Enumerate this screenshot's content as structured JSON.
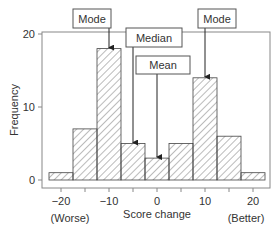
{
  "chart_data": {
    "type": "bar",
    "title": "",
    "xlabel": "Score change",
    "ylabel": "Frequency",
    "categories": [
      "-20",
      "-15",
      "-10",
      "-5",
      "0",
      "5",
      "10",
      "15",
      "20"
    ],
    "x": [
      -20,
      -15,
      -10,
      -5,
      0,
      5,
      10,
      15,
      20
    ],
    "values": [
      1,
      7,
      18,
      5,
      3,
      5,
      14,
      6,
      1
    ],
    "bin_width": 5,
    "xlim": [
      -23,
      24
    ],
    "ylim": [
      0,
      21
    ],
    "xticks": [
      -20,
      -15,
      -10,
      -5,
      0,
      5,
      10,
      15,
      20
    ],
    "xtick_labels": [
      "-20",
      "",
      "-10",
      "",
      "0",
      "",
      "10",
      "",
      "20"
    ],
    "yticks": [
      0,
      10,
      20
    ],
    "ytick_labels": [
      "0",
      "10",
      "20"
    ],
    "x_end_labels": {
      "left": "(Worse)",
      "right": "(Better)"
    },
    "grid": false,
    "fill": "diagonal hatch",
    "annotations": [
      {
        "text": "Mode",
        "points_to_x": -10,
        "points_to_y": 18
      },
      {
        "text": "Median",
        "points_to_x": -5,
        "points_to_y": 5
      },
      {
        "text": "Mean",
        "points_to_x": 0,
        "points_to_y": 3
      },
      {
        "text": "Mode",
        "points_to_x": 10,
        "points_to_y": 14
      }
    ]
  }
}
